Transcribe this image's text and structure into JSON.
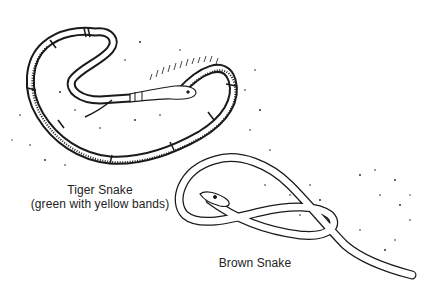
{
  "figure": {
    "type": "line-drawing illustration",
    "subjects": [
      {
        "name": "tiger-snake",
        "caption_line1": "Tiger Snake",
        "caption_line2": "(green with yellow bands)"
      },
      {
        "name": "brown-snake",
        "caption_line1": "Brown Snake"
      }
    ],
    "colors": {
      "background": "#ffffff",
      "ink": "#1a1a1a"
    }
  }
}
